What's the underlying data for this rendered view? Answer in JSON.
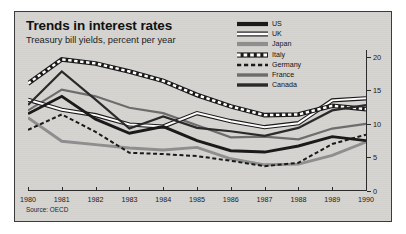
{
  "figure": {
    "title": "Trends in interest rates",
    "subtitle": "Treasury bill yields, percent per year",
    "source": "Source: OECD",
    "panel_bg": "#d6d5d1",
    "border_color": "#3b3b3b"
  },
  "legend": {
    "position": "top-right",
    "items": [
      {
        "label": "US",
        "style": "thick-solid-black",
        "color": "#1a1a1a"
      },
      {
        "label": "UK",
        "style": "outlined-white",
        "color": "#1a1a1a"
      },
      {
        "label": "Japan",
        "style": "thick-solid-gray",
        "color": "#8e8e8e"
      },
      {
        "label": "Italy",
        "style": "dash-dot-boxed",
        "color": "#1a1a1a"
      },
      {
        "label": "Germany",
        "style": "dashed-black",
        "color": "#1a1a1a"
      },
      {
        "label": "France",
        "style": "medium-solid-gray",
        "color": "#6d6d6d"
      },
      {
        "label": "Canada",
        "style": "medium-solid-black",
        "color": "#2a2a2a"
      }
    ]
  },
  "chart_data": {
    "type": "line",
    "title": "Trends in interest rates",
    "subtitle": "Treasury bill yields, percent per year",
    "xlabel": "",
    "ylabel": "percent per year",
    "grid": false,
    "legend_position": "top-right",
    "y_axis_side": "right",
    "ylim": [
      0,
      21
    ],
    "yticks": [
      0,
      5,
      10,
      15,
      20
    ],
    "ytick_labels": [
      "0",
      "5",
      "10",
      "15",
      "20"
    ],
    "x": [
      1980,
      1981,
      1982,
      1983,
      1984,
      1985,
      1986,
      1987,
      1988,
      1989,
      1990
    ],
    "xtick_labels": [
      "1980",
      "1981",
      "1982",
      "1983",
      "1984",
      "1985",
      "1986",
      "1987",
      "1988",
      "1989",
      "1990"
    ],
    "series": [
      {
        "name": "US",
        "color": "#1a1a1a",
        "style": "thick-solid-black",
        "values": [
          11.5,
          14.1,
          10.7,
          8.6,
          9.6,
          7.5,
          6.0,
          5.8,
          6.7,
          8.1,
          7.5
        ]
      },
      {
        "name": "UK",
        "color": "#1a1a1a",
        "style": "outlined-white",
        "values": [
          13.6,
          12.1,
          11.3,
          9.9,
          9.6,
          11.6,
          10.4,
          9.5,
          10.1,
          13.5,
          13.8
        ]
      },
      {
        "name": "Japan",
        "color": "#8e8e8e",
        "style": "thick-solid-gray",
        "values": [
          10.9,
          7.4,
          6.9,
          6.4,
          6.1,
          6.5,
          4.8,
          3.9,
          4.0,
          5.3,
          7.3
        ]
      },
      {
        "name": "Italy",
        "color": "#1a1a1a",
        "style": "dash-dot-boxed",
        "values": [
          16.0,
          19.6,
          19.0,
          17.8,
          16.4,
          14.3,
          12.6,
          11.3,
          11.4,
          12.7,
          12.2
        ]
      },
      {
        "name": "Germany",
        "color": "#1a1a1a",
        "style": "dashed-black",
        "values": [
          9.1,
          11.4,
          8.8,
          5.7,
          5.5,
          5.2,
          4.5,
          3.7,
          4.2,
          7.0,
          8.4
        ]
      },
      {
        "name": "France",
        "color": "#6d6d6d",
        "style": "medium-solid-gray",
        "values": [
          12.0,
          15.1,
          14.1,
          12.4,
          11.6,
          9.8,
          8.0,
          8.1,
          7.7,
          9.3,
          10.0
        ]
      },
      {
        "name": "Canada",
        "color": "#2a2a2a",
        "style": "medium-solid-black",
        "values": [
          12.8,
          17.8,
          13.6,
          9.3,
          11.1,
          9.4,
          8.9,
          8.2,
          9.4,
          12.0,
          12.8
        ]
      }
    ]
  }
}
